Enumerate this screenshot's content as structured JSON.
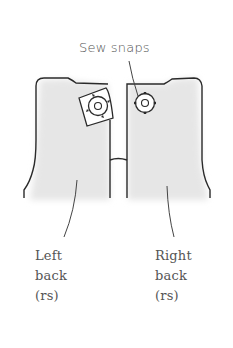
{
  "diagram": {
    "callout": "Sew snaps",
    "left_piece": {
      "lines": [
        "Left",
        "back",
        "(rs)"
      ]
    },
    "right_piece": {
      "lines": [
        "Right",
        "back",
        "(rs)"
      ]
    },
    "colors": {
      "outline": "#2a2a2a",
      "fill": "#e9e9e9",
      "text": "#555555",
      "background": "#ffffff"
    },
    "icons": [
      "snap-icon-left",
      "snap-icon-right",
      "square-snap-patch"
    ]
  }
}
